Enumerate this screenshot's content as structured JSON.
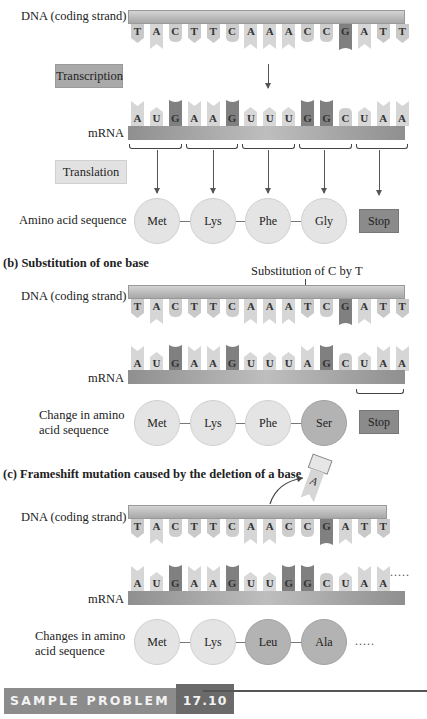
{
  "section_a": {
    "dna_label": "DNA (coding strand)",
    "dna_bases": [
      "T",
      "A",
      "C",
      "T",
      "T",
      "C",
      "A",
      "A",
      "A",
      "C",
      "C",
      "G",
      "A",
      "T",
      "T"
    ],
    "transcription_label": "Transcription",
    "mrna_label": "mRNA",
    "mrna_bases": [
      "A",
      "U",
      "G",
      "A",
      "A",
      "G",
      "U",
      "U",
      "U",
      "G",
      "G",
      "C",
      "U",
      "A",
      "A"
    ],
    "translation_label": "Translation",
    "aa_label": "Amino acid sequence",
    "amino_acids": [
      "Met",
      "Lys",
      "Phe",
      "Gly"
    ],
    "stop_label": "Stop"
  },
  "section_b": {
    "heading": "(b) Substitution of one base",
    "annotation": "Substitution of C by T",
    "dna_label": "DNA (coding strand)",
    "dna_bases": [
      "T",
      "A",
      "C",
      "T",
      "T",
      "C",
      "A",
      "A",
      "A",
      "T",
      "C",
      "G",
      "A",
      "T",
      "T"
    ],
    "mrna_label": "mRNA",
    "mrna_bases": [
      "A",
      "U",
      "G",
      "A",
      "A",
      "G",
      "U",
      "U",
      "U",
      "A",
      "G",
      "C",
      "U",
      "A",
      "A"
    ],
    "aa_label_line1": "Change in amino",
    "aa_label_line2": "acid sequence",
    "amino_acids": [
      "Met",
      "Lys",
      "Phe",
      "Ser"
    ],
    "stop_label": "Stop"
  },
  "section_c": {
    "heading": "(c) Frameshift mutation caused by the deletion of a base",
    "deleted_base": "A",
    "dna_label": "DNA (coding strand)",
    "dna_bases": [
      "T",
      "A",
      "C",
      "T",
      "T",
      "C",
      "A",
      "A",
      "C",
      "C",
      "G",
      "A",
      "T",
      "T"
    ],
    "mrna_label": "mRNA",
    "mrna_bases": [
      "A",
      "U",
      "G",
      "A",
      "A",
      "G",
      "U",
      "U",
      "G",
      "G",
      "C",
      "U",
      "A",
      "A"
    ],
    "aa_label_line1": "Changes in amino",
    "aa_label_line2": "acid sequence",
    "amino_acids": [
      "Met",
      "Lys",
      "Leu",
      "Ala"
    ],
    "continuation": "....."
  },
  "sample_problem": {
    "title": "SAMPLE PROBLEM",
    "number": "17.10"
  },
  "colors": {
    "base_T": "#c9c9c9",
    "base_A": "#d6d6d6",
    "base_C": "#cdcdcd",
    "base_G": "#808080",
    "base_U": "#d8d8d8",
    "stop_box": "#8b8b8b",
    "mutated_aa": "#b3b3b3"
  }
}
